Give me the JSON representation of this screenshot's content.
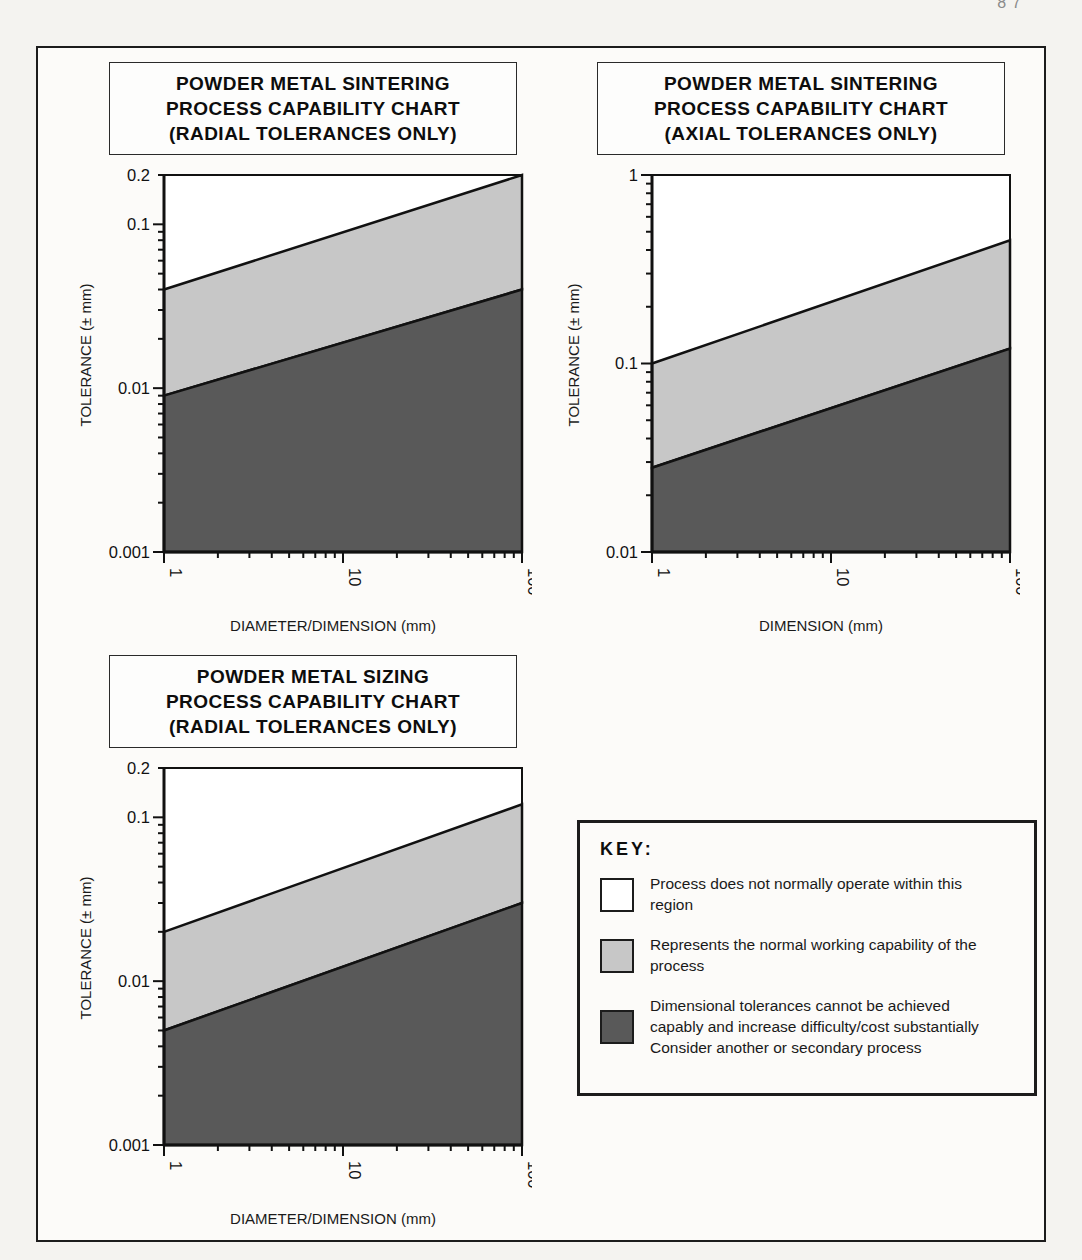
{
  "page": {
    "header_fragment": "87",
    "colors": {
      "ink": "#111111",
      "band_light": "#c7c7c7",
      "band_dark": "#595959",
      "plot_bg": "#ffffff"
    }
  },
  "key": {
    "title": "KEY:",
    "items": [
      {
        "swatch": "white",
        "label": "Process does not normally operate within this region"
      },
      {
        "swatch": "light-gray",
        "label": "Represents the normal working capability of the process"
      },
      {
        "swatch": "dark-gray",
        "label": "Dimensional tolerances cannot be achieved capably and increase difficulty/cost substantially Consider another or secondary process"
      }
    ]
  },
  "chart_data": [
    {
      "type": "area",
      "title_lines": [
        "POWDER METAL SINTERING",
        "PROCESS CAPABILITY CHART",
        "(RADIAL TOLERANCES ONLY)"
      ],
      "xlabel": "DIAMETER/DIMENSION (mm)",
      "ylabel": "TOLERANCE (± mm)",
      "x_scale": "log",
      "y_scale": "log",
      "xlim": [
        1,
        100
      ],
      "ylim": [
        0.001,
        0.2
      ],
      "x_tick_labels": [
        "1",
        "10",
        "100"
      ],
      "y_tick_labels": [
        "0.2",
        "0.1",
        "0.01",
        "0.001"
      ],
      "grid": false,
      "series": [
        {
          "name": "normal-capability-upper-boundary",
          "x": [
            1,
            100
          ],
          "y": [
            0.04,
            0.2
          ]
        },
        {
          "name": "capable-lower-boundary",
          "x": [
            1,
            100
          ],
          "y": [
            0.009,
            0.04
          ]
        }
      ],
      "regions": [
        "above-normal-white",
        "normal-working-capability-light",
        "not-capable-dark"
      ]
    },
    {
      "type": "area",
      "title_lines": [
        "POWDER METAL SINTERING",
        "PROCESS CAPABILITY CHART",
        "(AXIAL TOLERANCES ONLY)"
      ],
      "xlabel": "DIMENSION (mm)",
      "ylabel": "TOLERANCE (± mm)",
      "x_scale": "log",
      "y_scale": "log",
      "xlim": [
        1,
        100
      ],
      "ylim": [
        0.01,
        1
      ],
      "x_tick_labels": [
        "1",
        "10",
        "100"
      ],
      "y_tick_labels": [
        "1",
        "0.1",
        "0.01"
      ],
      "grid": false,
      "series": [
        {
          "name": "normal-capability-upper-boundary",
          "x": [
            1,
            100
          ],
          "y": [
            0.1,
            0.45
          ]
        },
        {
          "name": "capable-lower-boundary",
          "x": [
            1,
            100
          ],
          "y": [
            0.028,
            0.12
          ]
        }
      ],
      "regions": [
        "above-normal-white",
        "normal-working-capability-light",
        "not-capable-dark"
      ]
    },
    {
      "type": "area",
      "title_lines": [
        "POWDER METAL SIZING",
        "PROCESS CAPABILITY CHART",
        "(RADIAL TOLERANCES ONLY)"
      ],
      "xlabel": "DIAMETER/DIMENSION (mm)",
      "ylabel": "TOLERANCE (± mm)",
      "x_scale": "log",
      "y_scale": "log",
      "xlim": [
        1,
        100
      ],
      "ylim": [
        0.001,
        0.2
      ],
      "x_tick_labels": [
        "1",
        "10",
        "100"
      ],
      "y_tick_labels": [
        "0.2",
        "0.1",
        "0.01",
        "0.001"
      ],
      "grid": false,
      "series": [
        {
          "name": "normal-capability-upper-boundary",
          "x": [
            1,
            100
          ],
          "y": [
            0.02,
            0.12
          ]
        },
        {
          "name": "capable-lower-boundary",
          "x": [
            1,
            100
          ],
          "y": [
            0.005,
            0.03
          ]
        }
      ],
      "regions": [
        "above-normal-white",
        "normal-working-capability-light",
        "not-capable-dark"
      ]
    }
  ]
}
